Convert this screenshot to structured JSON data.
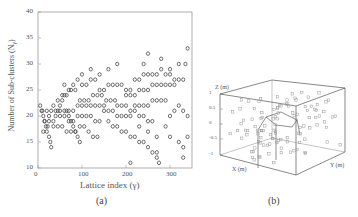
{
  "chart_data": [
    {
      "type": "scatter",
      "panel": "(a)",
      "title": "",
      "xlabel": "Lattice index (γ)",
      "ylabel": "Number of Sub-clusters (N_γ)",
      "xlim": [
        0,
        350
      ],
      "ylim": [
        10,
        40
      ],
      "xticks": [
        0,
        100,
        200,
        300
      ],
      "yticks": [
        10,
        15,
        20,
        25,
        30,
        35,
        40
      ],
      "grid": false,
      "marker": "open-circle",
      "series": [
        {
          "name": "sub-clusters",
          "points": [
            [
              5,
              22
            ],
            [
              8,
              21
            ],
            [
              12,
              20
            ],
            [
              15,
              19
            ],
            [
              18,
              18
            ],
            [
              20,
              17
            ],
            [
              25,
              16
            ],
            [
              28,
              15
            ],
            [
              30,
              14
            ],
            [
              12,
              17
            ],
            [
              22,
              18
            ],
            [
              35,
              19
            ],
            [
              40,
              20
            ],
            [
              45,
              21
            ],
            [
              50,
              22
            ],
            [
              55,
              23
            ],
            [
              60,
              24
            ],
            [
              65,
              21
            ],
            [
              70,
              20
            ],
            [
              75,
              19
            ],
            [
              80,
              18
            ],
            [
              85,
              17
            ],
            [
              90,
              16
            ],
            [
              95,
              15
            ],
            [
              10,
              21
            ],
            [
              20,
              21
            ],
            [
              30,
              21
            ],
            [
              40,
              21
            ],
            [
              50,
              21
            ],
            [
              60,
              21
            ],
            [
              70,
              21
            ],
            [
              80,
              21
            ],
            [
              90,
              20
            ],
            [
              100,
              20
            ],
            [
              110,
              20
            ],
            [
              120,
              20
            ],
            [
              130,
              19
            ],
            [
              140,
              19
            ],
            [
              15,
              19
            ],
            [
              25,
              19
            ],
            [
              35,
              18
            ],
            [
              45,
              18
            ],
            [
              55,
              18
            ],
            [
              65,
              17
            ],
            [
              75,
              17
            ],
            [
              85,
              17
            ],
            [
              95,
              18
            ],
            [
              105,
              18
            ],
            [
              115,
              17
            ],
            [
              125,
              16
            ],
            [
              135,
              16
            ],
            [
              50,
              20
            ],
            [
              60,
              20
            ],
            [
              70,
              19
            ],
            [
              80,
              19
            ],
            [
              90,
              22
            ],
            [
              100,
              22
            ],
            [
              110,
              22
            ],
            [
              120,
              22
            ],
            [
              130,
              22
            ],
            [
              140,
              22
            ],
            [
              150,
              22
            ],
            [
              55,
              24
            ],
            [
              65,
              24
            ],
            [
              75,
              25
            ],
            [
              85,
              25
            ],
            [
              95,
              23
            ],
            [
              105,
              23
            ],
            [
              115,
              23
            ],
            [
              125,
              24
            ],
            [
              135,
              24
            ],
            [
              145,
              24
            ],
            [
              155,
              23
            ],
            [
              165,
              23
            ],
            [
              175,
              23
            ],
            [
              100,
              26
            ],
            [
              110,
              26
            ],
            [
              120,
              27
            ],
            [
              130,
              27
            ],
            [
              140,
              25
            ],
            [
              150,
              25
            ],
            [
              160,
              26
            ],
            [
              170,
              26
            ],
            [
              180,
              26
            ],
            [
              190,
              26
            ],
            [
              200,
              25
            ],
            [
              210,
              25
            ],
            [
              150,
              21
            ],
            [
              160,
              21
            ],
            [
              170,
              21
            ],
            [
              180,
              22
            ],
            [
              190,
              22
            ],
            [
              200,
              22
            ],
            [
              210,
              21
            ],
            [
              220,
              21
            ],
            [
              230,
              20
            ],
            [
              240,
              20
            ],
            [
              250,
              19
            ],
            [
              260,
              19
            ],
            [
              160,
              19
            ],
            [
              170,
              18
            ],
            [
              180,
              18
            ],
            [
              190,
              17
            ],
            [
              200,
              17
            ],
            [
              210,
              16
            ],
            [
              220,
              16
            ],
            [
              230,
              15
            ],
            [
              240,
              15
            ],
            [
              250,
              14
            ],
            [
              260,
              13
            ],
            [
              270,
              12
            ],
            [
              180,
              20
            ],
            [
              190,
              20
            ],
            [
              200,
              20
            ],
            [
              210,
              20
            ],
            [
              220,
              22
            ],
            [
              230,
              22
            ],
            [
              240,
              22
            ],
            [
              250,
              22
            ],
            [
              260,
              23
            ],
            [
              270,
              23
            ],
            [
              280,
              23
            ],
            [
              290,
              23
            ],
            [
              200,
              24
            ],
            [
              210,
              24
            ],
            [
              220,
              24
            ],
            [
              230,
              25
            ],
            [
              240,
              25
            ],
            [
              250,
              25
            ],
            [
              260,
              26
            ],
            [
              270,
              26
            ],
            [
              280,
              26
            ],
            [
              290,
              26
            ],
            [
              300,
              26
            ],
            [
              310,
              26
            ],
            [
              220,
              27
            ],
            [
              230,
              27
            ],
            [
              240,
              28
            ],
            [
              250,
              28
            ],
            [
              260,
              28
            ],
            [
              270,
              28
            ],
            [
              280,
              29
            ],
            [
              290,
              28
            ],
            [
              300,
              28
            ],
            [
              310,
              27
            ],
            [
              320,
              27
            ],
            [
              330,
              27
            ],
            [
              230,
              18
            ],
            [
              250,
              17
            ],
            [
              270,
              16
            ],
            [
              290,
              18
            ],
            [
              300,
              20
            ],
            [
              310,
              21
            ],
            [
              320,
              22
            ],
            [
              330,
              21
            ],
            [
              340,
              20
            ],
            [
              300,
              16
            ],
            [
              320,
              15
            ],
            [
              330,
              14
            ],
            [
              240,
              30
            ],
            [
              280,
              31
            ],
            [
              300,
              29
            ],
            [
              320,
              30
            ],
            [
              335,
              30
            ],
            [
              340,
              33
            ],
            [
              250,
              32
            ],
            [
              270,
              13
            ],
            [
              210,
              11
            ],
            [
              275,
              11
            ],
            [
              330,
              12
            ],
            [
              340,
              16
            ],
            [
              140,
              28
            ],
            [
              160,
              29
            ],
            [
              180,
              30
            ],
            [
              120,
              29
            ],
            [
              100,
              28
            ],
            [
              90,
              27
            ],
            [
              80,
              26
            ],
            [
              70,
              25
            ],
            [
              60,
              26
            ],
            [
              45,
              23
            ],
            [
              35,
              22
            ],
            [
              25,
              20
            ]
          ]
        }
      ]
    },
    {
      "type": "scatter3d",
      "panel": "(b)",
      "xlabel": "X (m)",
      "ylabel": "Y (m)",
      "zlabel": "Z (m)",
      "zticks": [
        -1,
        -0.5,
        0,
        0.5,
        1
      ],
      "marker": "open-square"
    }
  ],
  "captions": {
    "a": "(a)",
    "b": "(b)"
  },
  "axes_a": {
    "xticks": [
      "0",
      "100",
      "200",
      "300"
    ],
    "yticks": [
      "10",
      "15",
      "20",
      "25",
      "30",
      "35",
      "40"
    ],
    "xlabel": "Lattice index (γ)",
    "ylabel": "Number of Sub-clusters (N",
    "ylabel_sub": "γ",
    "ylabel_end": ")"
  },
  "axes_b": {
    "zlabel": "Z (m)",
    "xlabel": "X (m)",
    "ylabel": "Y (m)",
    "zticks": [
      "1",
      "0.5",
      "0",
      "-0.5",
      "-1"
    ]
  }
}
